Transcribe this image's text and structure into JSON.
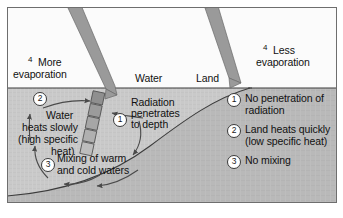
{
  "figure": {
    "colors": {
      "sky": "#fbfbfb",
      "water": "#c9c9c9",
      "land": "#b9b9b9",
      "ray": "#9a9a9a",
      "ray_outline": "#5a5a5a",
      "line": "#3c3c3c",
      "text": "#111111",
      "badge_fill": "#ffffff"
    },
    "regions": {
      "water_label": "Water",
      "land_label": "Land"
    },
    "rays": [
      {
        "name": "solar-ray-water",
        "angle_deg": 28
      },
      {
        "name": "solar-ray-land",
        "angle_deg": 20
      }
    ],
    "evaporation": {
      "left": {
        "marker": "4",
        "line1": "More",
        "line2": "evaporation"
      },
      "right": {
        "marker": "4",
        "line1": "Less",
        "line2": "evaporation"
      }
    },
    "water_notes": [
      {
        "marker": "1",
        "lines": [
          "Radiation",
          "penetrates",
          "to depth"
        ]
      },
      {
        "marker": "2",
        "lines": [
          "Water",
          "heats slowly",
          "(high specific",
          "heat)"
        ]
      },
      {
        "marker": "3",
        "lines": [
          "Mixing of warm",
          "and cold waters"
        ]
      }
    ],
    "land_notes": [
      {
        "marker": "1",
        "lines": [
          "No penetration of",
          "radiation"
        ]
      },
      {
        "marker": "2",
        "lines": [
          "Land heats quickly",
          "(low specific heat)"
        ]
      },
      {
        "marker": "3",
        "lines": [
          "No mixing"
        ]
      }
    ],
    "penetration_segments": 5
  }
}
